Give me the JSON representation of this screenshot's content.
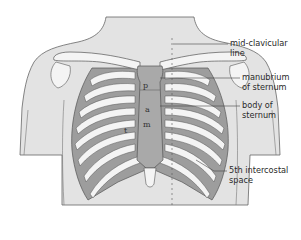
{
  "diagram": {
    "colors": {
      "skin": "#e3e3e3",
      "outline": "#555555",
      "rib": "#f4f4f4",
      "intercostal": "#9d9d9d",
      "sternum": "#a9a9a9",
      "background": "#ffffff"
    },
    "labels": [
      {
        "id": "mid-clavicular",
        "lines": [
          "mid-clavicular",
          "line"
        ]
      },
      {
        "id": "manubrium",
        "lines": [
          "manubrium",
          "of sternum"
        ]
      },
      {
        "id": "body-sternum",
        "lines": [
          "body of",
          "sternum"
        ]
      },
      {
        "id": "intercostal",
        "lines": [
          "5th intercostal",
          "space"
        ]
      }
    ],
    "sternum_letters": [
      "p",
      "a",
      "m",
      "t"
    ]
  }
}
